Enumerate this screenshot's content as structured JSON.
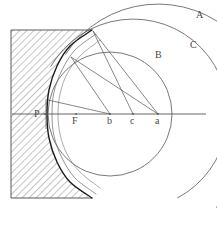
{
  "figure": {
    "background_color": "#ffffff",
    "width": 217,
    "height": 230,
    "ink_color": "#555555",
    "dark_ink_color": "#1a1a1a",
    "hatch_color": "#8a8a8a"
  },
  "labels": {
    "arc_a": "A",
    "arc_c": "C",
    "arc_b": "B",
    "point_P": "P",
    "point_F": "F",
    "point_b": "b",
    "point_c": "c",
    "point_a": "a"
  },
  "chart_data": {
    "type": "diagram",
    "xlabel": "",
    "ylabel": "",
    "grid": false,
    "legend": "none",
    "axis_line": {
      "name": "optical-axis",
      "y": 114,
      "x_start": 12,
      "x_end": 206
    },
    "medium_block": {
      "name": "hatched-medium",
      "x": 11,
      "y": 30,
      "width": 81,
      "height": 168,
      "hatch_angle_deg": 45,
      "hatch_spacing_px": 5
    },
    "axis_points": [
      {
        "label": "P",
        "x": 45,
        "y": 114,
        "label_x": 34,
        "label_y": 117
      },
      {
        "label": "F",
        "x": 76,
        "y": 114,
        "label_x": 72,
        "label_y": 124
      },
      {
        "label": "b",
        "x": 110,
        "y": 114,
        "label_x": 107,
        "label_y": 124
      },
      {
        "label": "c",
        "x": 133,
        "y": 114,
        "label_x": 130,
        "label_y": 124
      },
      {
        "label": "a",
        "x": 158,
        "y": 114,
        "label_x": 155,
        "label_y": 124
      }
    ],
    "arcs": [
      {
        "name": "arc-A",
        "label": "A",
        "label_x": 196,
        "label_y": 18,
        "center_x": 158,
        "center_y": 114,
        "radius": 110,
        "start_angle_deg": 213,
        "end_angle_deg": 58,
        "stroke": "#555555",
        "stroke_width": 0.8
      },
      {
        "name": "arc-C",
        "label": "C",
        "label_x": 190,
        "label_y": 48,
        "center_x": 133,
        "center_y": 114,
        "radius": 95,
        "start_angle_deg": 210,
        "end_angle_deg": 62,
        "stroke": "#555555",
        "stroke_width": 0.8
      },
      {
        "name": "arc-B",
        "label": "B",
        "label_x": 155,
        "label_y": 58,
        "center_x": 110,
        "center_y": 114,
        "radius": 62,
        "start_angle_deg": 0,
        "end_angle_deg": 360,
        "stroke": "#555555",
        "stroke_width": 0.8
      }
    ],
    "caustic_curves": [
      {
        "name": "caustic-outer",
        "description": "dark envelope curve tangent to all wavefronts near P",
        "points": [
          [
            92,
            30
          ],
          [
            70,
            46
          ],
          [
            57,
            66
          ],
          [
            49,
            90
          ],
          [
            47,
            114
          ],
          [
            49,
            138
          ],
          [
            57,
            162
          ],
          [
            70,
            182
          ],
          [
            92,
            198
          ]
        ],
        "stroke": "#1a1a1a",
        "stroke_width": 1.4
      },
      {
        "name": "caustic-inner-1",
        "points": [
          [
            96,
            34
          ],
          [
            75,
            50
          ],
          [
            62,
            70
          ],
          [
            54,
            92
          ],
          [
            52,
            114
          ],
          [
            54,
            136
          ],
          [
            62,
            158
          ],
          [
            75,
            178
          ],
          [
            96,
            194
          ]
        ],
        "stroke": "#666666",
        "stroke_width": 0.7
      },
      {
        "name": "caustic-inner-2",
        "points": [
          [
            100,
            40
          ],
          [
            80,
            56
          ],
          [
            67,
            74
          ],
          [
            60,
            94
          ],
          [
            58,
            114
          ],
          [
            60,
            134
          ],
          [
            67,
            154
          ],
          [
            80,
            172
          ],
          [
            100,
            188
          ]
        ],
        "stroke": "#888888",
        "stroke_width": 0.7
      }
    ],
    "rays": [
      {
        "name": "ray-a-to-top",
        "x1": 158,
        "y1": 114,
        "x2": 93,
        "y2": 31
      },
      {
        "name": "ray-c-to-top",
        "x1": 133,
        "y1": 114,
        "x2": 93,
        "y2": 31
      },
      {
        "name": "ray-b-to-upper",
        "x1": 110,
        "y1": 114,
        "x2": 71,
        "y2": 57
      },
      {
        "name": "ray-b-to-P-side",
        "x1": 110,
        "y1": 114,
        "x2": 48,
        "y2": 100
      },
      {
        "name": "ray-a-to-upper",
        "x1": 158,
        "y1": 114,
        "x2": 71,
        "y2": 57
      }
    ],
    "vertical_tick": {
      "name": "P-vertical-tick",
      "x": 46,
      "y_top": 99,
      "y_bottom": 129
    }
  }
}
